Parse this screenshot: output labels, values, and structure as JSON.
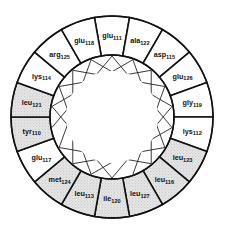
{
  "diagram": {
    "type": "helical-wheel",
    "center": [
      112,
      117
    ],
    "outer_radius": 101,
    "inner_radius": 62,
    "core_radius": 46,
    "segment_count": 18,
    "start_angle_deg": -90,
    "colors": {
      "line": "#111111",
      "shaded": "#d9d9d9",
      "background": "#ffffff"
    },
    "residues": [
      {
        "name": "glu",
        "number": "111",
        "shaded": false
      },
      {
        "name": "ala",
        "number": "122",
        "shaded": false
      },
      {
        "name": "asp",
        "number": "115",
        "shaded": false
      },
      {
        "name": "glu",
        "number": "126",
        "shaded": false
      },
      {
        "name": "gly",
        "number": "119",
        "shaded": false
      },
      {
        "name": "lys",
        "number": "112",
        "shaded": false
      },
      {
        "name": "leu",
        "number": "123",
        "shaded": true
      },
      {
        "name": "leu",
        "number": "116",
        "shaded": true
      },
      {
        "name": "leu",
        "number": "127",
        "shaded": true
      },
      {
        "name": "ile",
        "number": "120",
        "shaded": true
      },
      {
        "name": "leu",
        "number": "113",
        "shaded": true
      },
      {
        "name": "met",
        "number": "124",
        "shaded": true
      },
      {
        "name": "glu",
        "number": "117",
        "shaded": false
      },
      {
        "name": "tyr",
        "number": "110",
        "shaded": true
      },
      {
        "name": "leu",
        "number": "121",
        "shaded": true
      },
      {
        "name": "lys",
        "number": "114",
        "shaded": false
      },
      {
        "name": "arg",
        "number": "125",
        "shaded": false
      },
      {
        "name": "glu",
        "number": "118",
        "shaded": false
      }
    ],
    "sequence_order": [
      "110",
      "111",
      "112",
      "113",
      "114",
      "115",
      "116",
      "117",
      "118",
      "119",
      "120",
      "121",
      "122",
      "123",
      "124",
      "125",
      "126",
      "127"
    ]
  }
}
